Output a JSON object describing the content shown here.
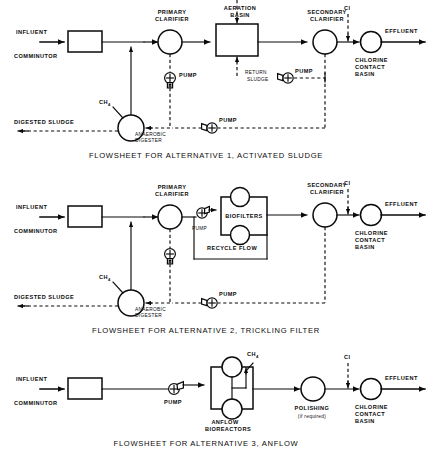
{
  "page": {
    "background": "#ffffff",
    "ink": "#0a0a0a",
    "width": 434,
    "height": 463
  },
  "glossary": {
    "influent": "INFLUENT",
    "effluent": "EFFLUENT",
    "comminutor": "COMMINUTOR",
    "primary_clarifier_l1": "PRIMARY",
    "primary_clarifier_l2": "CLARIFIER",
    "aeration_basin_l1": "AERATION",
    "aeration_basin_l2": "BASIN",
    "secondary_clarifier_l1": "SECONDARY",
    "secondary_clarifier_l2": "CLARIFIER",
    "chlorine_l1": "CHLORINE",
    "chlorine_l2": "CONTACT",
    "chlorine_l3": "BASIN",
    "cl": "Cl",
    "pump": "PUMP",
    "return_sludge_l1": "RETURN",
    "return_sludge_l2": "SLUDGE",
    "digested_sludge": "DIGESTED SLUDGE",
    "anaerobic_l1": "ANAEROBIC",
    "anaerobic_l2": "DIGESTER",
    "ch4": "CH",
    "ch4_sub": "4",
    "biofilters": "BIOFILTERS",
    "recycle_flow": "RECYCLE   FLOW",
    "anflow_l1": "ANFLOW",
    "anflow_l2": "BIOREACTORS",
    "polishing": "POLISHING",
    "polishing_note": "(if required)"
  },
  "flowsheets": [
    {
      "id": "alternative-1",
      "caption": "FLOWSHEET FOR ALTERNATIVE 1, ACTIVATED SLUDGE",
      "units": [
        "COMMINUTOR",
        "PRIMARY CLARIFIER",
        "AERATION BASIN",
        "SECONDARY CLARIFIER",
        "CHLORINE CONTACT BASIN",
        "ANAEROBIC DIGESTER"
      ],
      "pumps": 3,
      "streams": [
        "INFLUENT",
        "EFFLUENT",
        "RETURN SLUDGE",
        "DIGESTED SLUDGE",
        "CH4",
        "Cl"
      ]
    },
    {
      "id": "alternative-2",
      "caption": "FLOWSHEET FOR ALTERNATIVE 2, TRICKLING FILTER",
      "units": [
        "COMMINUTOR",
        "PRIMARY CLARIFIER",
        "BIOFILTERS",
        "SECONDARY CLARIFIER",
        "CHLORINE CONTACT BASIN",
        "ANAEROBIC DIGESTER"
      ],
      "pumps": 3,
      "streams": [
        "INFLUENT",
        "EFFLUENT",
        "RECYCLE FLOW",
        "DIGESTED SLUDGE",
        "CH4",
        "Cl"
      ]
    },
    {
      "id": "alternative-3",
      "caption": "FLOWSHEET FOR ALTERNATIVE 3, ANFLOW",
      "units": [
        "COMMINUTOR",
        "ANFLOW BIOREACTORS",
        "POLISHING",
        "CHLORINE CONTACT BASIN"
      ],
      "pumps": 1,
      "streams": [
        "INFLUENT",
        "EFFLUENT",
        "CH4",
        "Cl"
      ]
    }
  ]
}
